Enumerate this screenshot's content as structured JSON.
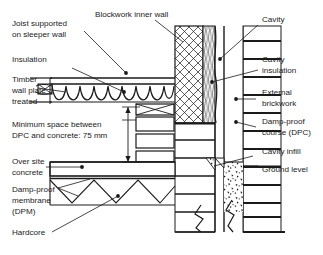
{
  "diagram": {
    "type": "architectural-cross-section",
    "canvas": {
      "width": 323,
      "height": 255,
      "background": "#ffffff"
    },
    "line_color": "#1a1a1a",
    "text_color": "#1a1a1a"
  },
  "labels": {
    "joist_supported": {
      "line1": "Joist supported",
      "line2": "on sleeper wall"
    },
    "insulation": {
      "line1": "Insulation"
    },
    "timber_wall_plate": {
      "line1": "Timber",
      "line2": "wall plate",
      "line3": "treated"
    },
    "minimum_space": {
      "line1": "Minimum space between",
      "line2": "DPC and concrete: 75 mm"
    },
    "over_site_concrete": {
      "line1": "Over site",
      "line2": "concrete"
    },
    "damp_proof_membrane": {
      "line1": "Damp-proof",
      "line2": "membrane",
      "line3": "(DPM)"
    },
    "hardcore": {
      "line1": "Hardcore"
    },
    "blockwork_inner_wall": {
      "line1": "Blockwork inner wall"
    },
    "cavity": {
      "line1": "Cavity"
    },
    "cavity_insulation": {
      "line1": "Cavity",
      "line2": "insulation"
    },
    "external_brickwork": {
      "line1": "External",
      "line2": "brickwork"
    },
    "damp_proof_course": {
      "line1": "Damp-proof",
      "line2": "course (DPC)"
    },
    "cavity_infill": {
      "line1": "Cavity infill"
    },
    "ground_level": {
      "line1": "Ground level"
    }
  },
  "dimension": {
    "value": "75 mm",
    "description": "Minimum space between DPC and concrete"
  },
  "components": [
    {
      "name": "joist",
      "label": "Joist supported on sleeper wall"
    },
    {
      "name": "insulation",
      "label": "Insulation"
    },
    {
      "name": "timber-wall-plate",
      "label": "Timber wall plate treated"
    },
    {
      "name": "over-site-concrete",
      "label": "Over site concrete"
    },
    {
      "name": "damp-proof-membrane",
      "label": "Damp-proof membrane (DPM)"
    },
    {
      "name": "hardcore",
      "label": "Hardcore"
    },
    {
      "name": "blockwork-inner-wall",
      "label": "Blockwork inner wall"
    },
    {
      "name": "cavity",
      "label": "Cavity"
    },
    {
      "name": "cavity-insulation",
      "label": "Cavity insulation"
    },
    {
      "name": "external-brickwork",
      "label": "External brickwork"
    },
    {
      "name": "damp-proof-course",
      "label": "Damp-proof course (DPC)"
    },
    {
      "name": "cavity-infill",
      "label": "Cavity infill"
    },
    {
      "name": "ground-level",
      "label": "Ground level"
    }
  ]
}
